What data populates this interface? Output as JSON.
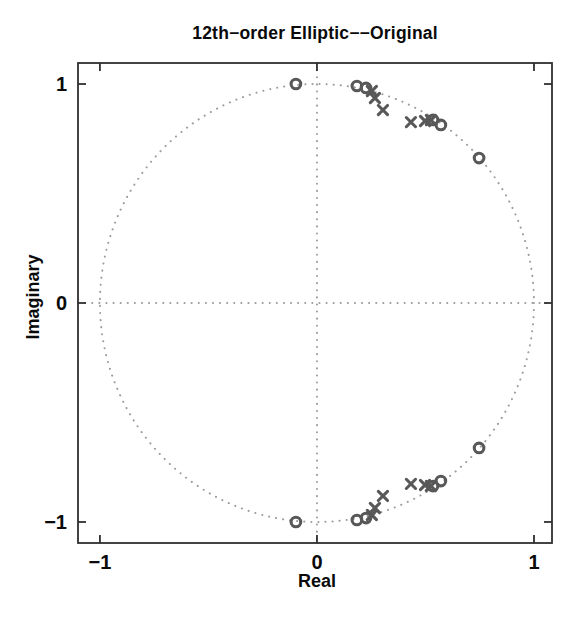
{
  "figure": {
    "title": "12th−order Elliptic−−Original",
    "xlabel": "Real",
    "ylabel": "Imaginary"
  },
  "chart_data": {
    "type": "scatter",
    "subtype": "pole-zero-plot",
    "title": "12th−order Elliptic−−Original",
    "xlabel": "Real",
    "ylabel": "Imaginary",
    "xlim": [
      -1.101,
      1.083
    ],
    "ylim": [
      -1.096,
      1.096
    ],
    "xticks": [
      -1,
      0,
      1
    ],
    "yticks": [
      -1,
      0,
      1
    ],
    "unit_circle": true,
    "zero_axis_lines": "dotted",
    "grid": false,
    "legend": false,
    "colors": {
      "marker": "#585858",
      "dotted_line": "#9b9b9b",
      "axes_box": "#2f2f2f",
      "text": "#0a0a0a",
      "background": "#ffffff"
    },
    "series": [
      {
        "name": "zeros",
        "marker": "o",
        "points": [
          [
            -0.097,
            1.0
          ],
          [
            0.184,
            0.991
          ],
          [
            0.226,
            0.982
          ],
          [
            0.535,
            0.836
          ],
          [
            0.571,
            0.813
          ],
          [
            0.747,
            0.662
          ],
          [
            -0.097,
            -1.0
          ],
          [
            0.184,
            -0.991
          ],
          [
            0.226,
            -0.982
          ],
          [
            0.535,
            -0.836
          ],
          [
            0.571,
            -0.813
          ],
          [
            0.747,
            -0.662
          ]
        ]
      },
      {
        "name": "poles",
        "marker": "x",
        "points": [
          [
            0.253,
            0.968
          ],
          [
            0.267,
            0.936
          ],
          [
            0.304,
            0.881
          ],
          [
            0.433,
            0.826
          ],
          [
            0.498,
            0.831
          ],
          [
            0.525,
            0.836
          ],
          [
            0.253,
            -0.968
          ],
          [
            0.267,
            -0.936
          ],
          [
            0.304,
            -0.881
          ],
          [
            0.433,
            -0.826
          ],
          [
            0.498,
            -0.831
          ],
          [
            0.525,
            -0.836
          ]
        ]
      }
    ]
  }
}
